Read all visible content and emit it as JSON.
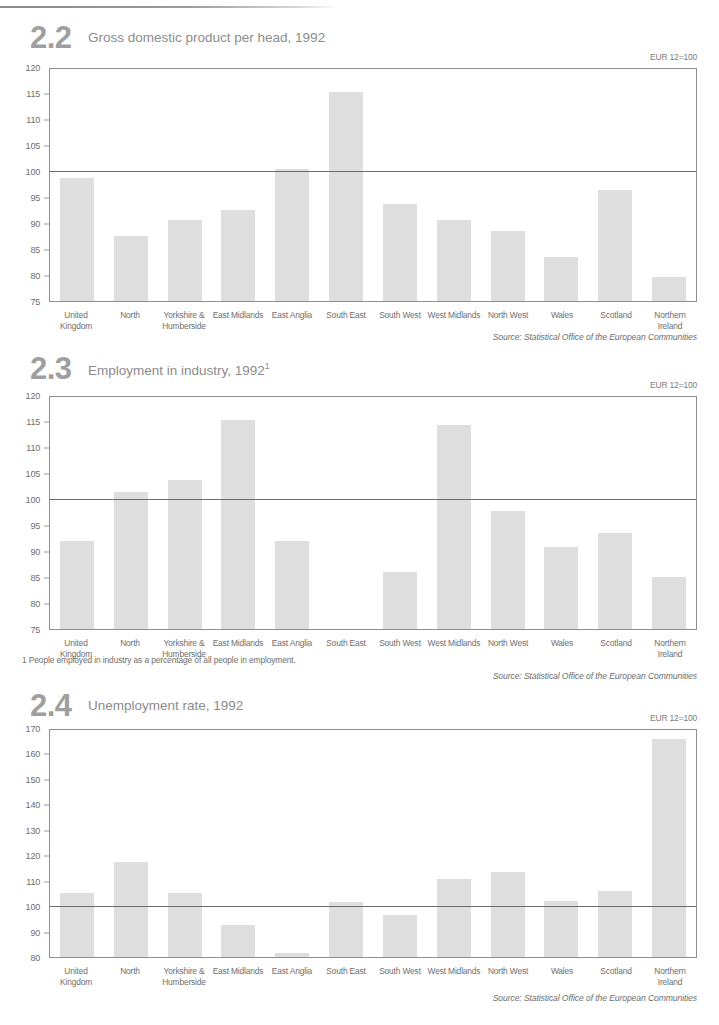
{
  "page": {
    "categories": [
      "United\nKingdom",
      "North",
      "Yorkshire &\nHumberside",
      "East Midlands",
      "East Anglia",
      "South East",
      "South West",
      "West Midlands",
      "North West",
      "Wales",
      "Scotland",
      "Northern\nIreland"
    ],
    "source_text": "Source: Statistical Office of the European Communities",
    "index_note": "EUR 12=100",
    "bar_color": "#dedede",
    "axis_color": "#8f8f8f",
    "baseline_color": "#6b6b6b",
    "label_color": "#6e6e6e",
    "title_color": "#8c8c8c",
    "number_color": "#9f9f9f"
  },
  "charts": [
    {
      "number": "2.2",
      "title": "Gross domestic product per head, 1992",
      "footnote": "",
      "note": "EUR 12=100",
      "source": "Source: Statistical Office of the European Communities"
    },
    {
      "number": "2.3",
      "title": "Employment in industry, 1992",
      "title_sup": "1",
      "footnote": "1 People employed in industry as a percentage of all people in employment.",
      "note": "EUR 12=100",
      "source": "Source: Statistical Office of the European Communities"
    },
    {
      "number": "2.4",
      "title": "Unemployment rate, 1992",
      "footnote": "",
      "note": "EUR 12=100",
      "source": "Source: Statistical Office of the European Communities"
    }
  ],
  "chart_data": [
    {
      "type": "bar",
      "title": "Gross domestic product per head, 1992",
      "chart_number": "2.2",
      "xlabel": "",
      "ylabel": "",
      "ylim": [
        75,
        120
      ],
      "yticks": [
        75,
        80,
        85,
        90,
        95,
        100,
        105,
        110,
        115,
        120
      ],
      "reference_line": 100,
      "grid": false,
      "legend": null,
      "annotations": [
        "EUR 12=100"
      ],
      "categories": [
        "United Kingdom",
        "North",
        "Yorkshire & Humberside",
        "East Midlands",
        "East Anglia",
        "South East",
        "South West",
        "West Midlands",
        "North West",
        "Wales",
        "Scotland",
        "Northern Ireland"
      ],
      "values": [
        98.8,
        87.7,
        90.7,
        92.7,
        100.7,
        115.6,
        93.8,
        90.8,
        88.6,
        83.6,
        96.5,
        79.6
      ]
    },
    {
      "type": "bar",
      "title": "Employment in industry, 1992",
      "chart_number": "2.3",
      "xlabel": "",
      "ylabel": "",
      "ylim": [
        75,
        120
      ],
      "yticks": [
        75,
        80,
        85,
        90,
        95,
        100,
        105,
        110,
        115,
        120
      ],
      "reference_line": 100,
      "grid": false,
      "legend": null,
      "annotations": [
        "EUR 12=100",
        "1 People employed in industry as a percentage of all people in employment."
      ],
      "categories": [
        "United Kingdom",
        "North",
        "Yorkshire & Humberside",
        "East Midlands",
        "East Anglia",
        "South East",
        "South West",
        "West Midlands",
        "North West",
        "Wales",
        "Scotland",
        "Northern Ireland"
      ],
      "values": [
        92.1,
        101.6,
        103.9,
        115.5,
        92.1,
        null,
        86.1,
        114.5,
        97.9,
        91.0,
        93.6,
        85.1
      ]
    },
    {
      "type": "bar",
      "title": "Unemployment rate, 1992",
      "chart_number": "2.4",
      "xlabel": "",
      "ylabel": "",
      "ylim": [
        80,
        170
      ],
      "yticks": [
        80,
        90,
        100,
        110,
        120,
        130,
        140,
        150,
        160,
        170
      ],
      "reference_line": 100,
      "grid": false,
      "legend": null,
      "annotations": [
        "EUR 12=100"
      ],
      "categories": [
        "United Kingdom",
        "North",
        "Yorkshire & Humberside",
        "East Midlands",
        "East Anglia",
        "South East",
        "South West",
        "West Midlands",
        "North West",
        "Wales",
        "Scotland",
        "Northern Ireland"
      ],
      "values": [
        105.4,
        117.6,
        105.2,
        92.8,
        81.4,
        101.9,
        96.5,
        111.0,
        113.8,
        102.1,
        106.1,
        166.5
      ]
    }
  ]
}
